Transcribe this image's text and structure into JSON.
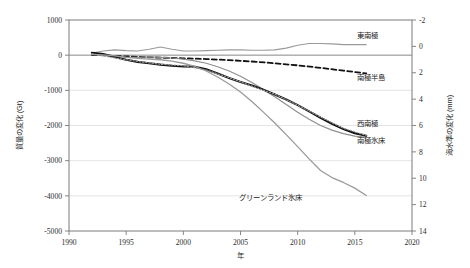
{
  "chart_data": {
    "type": "line",
    "title": "",
    "xlabel": "年",
    "ylabel": "質量の変化 (Gt)",
    "y2label": "海水準の変化 (mm)",
    "xlim": [
      1990,
      2020
    ],
    "ylim": [
      -5000,
      1000
    ],
    "y2lim": [
      14,
      -2
    ],
    "xticks": [
      "1990",
      "1995",
      "2000",
      "2005",
      "2010",
      "2015",
      "2020"
    ],
    "xtick_values": [
      1990,
      1995,
      2000,
      2005,
      2010,
      2015,
      2020
    ],
    "yticks": [
      "1000",
      "0",
      "-1000",
      "-2000",
      "-3000",
      "-4000",
      "-5000"
    ],
    "ytick_values": [
      1000,
      0,
      -1000,
      -2000,
      -3000,
      -4000,
      -5000
    ],
    "y2ticks": [
      "-2",
      "0",
      "2",
      "4",
      "6",
      "8",
      "10",
      "12",
      "14"
    ],
    "y2tick_values": [
      -2,
      0,
      2,
      4,
      6,
      8,
      10,
      12,
      14
    ],
    "grid": true,
    "legend_position": "inline-right",
    "series": [
      {
        "name": "東南極",
        "label": "東南極",
        "color": "#9a9a9a",
        "style": "solid",
        "width": 1.1,
        "label_x": 2015.2,
        "label_y": 560,
        "x": [
          1992,
          1993,
          1994,
          1995,
          1996,
          1997,
          1998,
          1999,
          2000,
          2001,
          2002,
          2003,
          2004,
          2005,
          2006,
          2007,
          2008,
          2009,
          2010,
          2011,
          2012,
          2013,
          2014,
          2015,
          2016
        ],
        "values": [
          60,
          120,
          150,
          130,
          120,
          170,
          230,
          170,
          120,
          120,
          130,
          140,
          150,
          150,
          140,
          140,
          150,
          200,
          280,
          330,
          330,
          320,
          300,
          300,
          300
        ]
      },
      {
        "name": "南極半島",
        "label": "南極半島",
        "color": "#111111",
        "style": "dashed",
        "width": 1.8,
        "label_x": 2015.2,
        "label_y": -620,
        "x": [
          1992,
          1994,
          1996,
          1998,
          2000,
          2002,
          2004,
          2006,
          2008,
          2010,
          2012,
          2014,
          2016
        ],
        "values": [
          10,
          -20,
          -50,
          -70,
          -90,
          -110,
          -140,
          -180,
          -230,
          -290,
          -360,
          -440,
          -520
        ]
      },
      {
        "name": "西南極",
        "label": "西南極",
        "color": "#8f8f8f",
        "style": "solid",
        "width": 1.2,
        "label_x": 2015.2,
        "label_y": -1930,
        "x": [
          1992,
          1993,
          1994,
          1995,
          1996,
          1997,
          1998,
          1999,
          2000,
          2001,
          2002,
          2003,
          2004,
          2005,
          2006,
          2007,
          2008,
          2009,
          2010,
          2011,
          2012,
          2013,
          2014,
          2015,
          2016
        ],
        "values": [
          20,
          0,
          -30,
          -60,
          -60,
          -50,
          -60,
          -80,
          -110,
          -160,
          -230,
          -330,
          -450,
          -600,
          -780,
          -980,
          -1180,
          -1400,
          -1620,
          -1820,
          -2000,
          -2130,
          -2230,
          -2300,
          -2340
        ]
      },
      {
        "name": "南極氷床",
        "label": "南極氷床",
        "color": "#111111",
        "style": "solid",
        "width": 2.1,
        "label_x": 2015.2,
        "label_y": -2420,
        "x": [
          1992,
          1993,
          1994,
          1995,
          1996,
          1997,
          1998,
          1999,
          2000,
          2001,
          2002,
          2003,
          2004,
          2005,
          2006,
          2007,
          2008,
          2009,
          2010,
          2011,
          2012,
          2013,
          2014,
          2015,
          2016
        ],
        "values": [
          70,
          30,
          -50,
          -130,
          -190,
          -230,
          -270,
          -300,
          -320,
          -330,
          -400,
          -520,
          -650,
          -760,
          -860,
          -980,
          -1120,
          -1260,
          -1420,
          -1600,
          -1780,
          -1950,
          -2100,
          -2220,
          -2290
        ]
      },
      {
        "name": "南極氷床 (不確実性)",
        "label": "",
        "color": "#9c9c9c",
        "style": "dotted",
        "width": 1.1,
        "label_x": null,
        "label_y": null,
        "x": [
          1992,
          1994,
          1996,
          1998,
          2000,
          2002,
          2004,
          2006,
          2008,
          2010,
          2012,
          2014,
          2016
        ],
        "values": [
          40,
          -80,
          -180,
          -260,
          -300,
          -420,
          -640,
          -880,
          -1110,
          -1420,
          -1760,
          -2080,
          -2280
        ]
      },
      {
        "name": "グリーンランド氷床",
        "label": "グリーンランド氷床",
        "color": "#9a9a9a",
        "style": "solid",
        "width": 1.3,
        "label_x": 2007.6,
        "label_y": -4040,
        "x": [
          1992,
          1993,
          1994,
          1995,
          1996,
          1997,
          1998,
          1999,
          2000,
          2001,
          2002,
          2003,
          2004,
          2005,
          2006,
          2007,
          2008,
          2009,
          2010,
          2011,
          2012,
          2013,
          2014,
          2015,
          2016
        ],
        "values": [
          20,
          10,
          -20,
          -60,
          -90,
          -110,
          -130,
          -170,
          -230,
          -320,
          -450,
          -620,
          -820,
          -1050,
          -1320,
          -1620,
          -1930,
          -2260,
          -2600,
          -2950,
          -3280,
          -3480,
          -3620,
          -3780,
          -3990
        ]
      }
    ]
  },
  "axes": {
    "left_title": "質量の変化 (Gt)",
    "right_title": "海水準の変化 (mm)",
    "bottom_title": "年"
  }
}
